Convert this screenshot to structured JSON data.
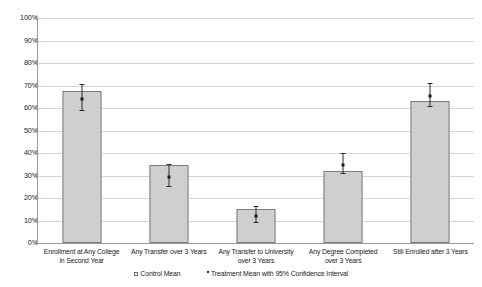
{
  "chart_data": {
    "type": "bar",
    "title": "",
    "xlabel": "",
    "ylabel": "",
    "ylim": [
      0,
      100
    ],
    "grid": true,
    "legend_position": "bottom",
    "y_tick_labels": [
      "100%",
      "90%",
      "80%",
      "70%",
      "60%",
      "50%",
      "40%",
      "30%",
      "20%",
      "10%",
      "0%"
    ],
    "y_tick_values": [
      100,
      90,
      80,
      70,
      60,
      50,
      40,
      30,
      20,
      10,
      0
    ],
    "categories": [
      "Enrollment at Any College in Second Year",
      "Any Transfer over 3 Years",
      "Any Transfer to University over 3 Years",
      "Any Degree Completed over 3 Years",
      "Still Enrolled after 3 Years"
    ],
    "category_labels": [
      [
        "Enrollment at Any College",
        "in Second Year"
      ],
      [
        "Any Transfer over 3 Years",
        ""
      ],
      [
        "Any Transfer to University",
        "over 3 Years"
      ],
      [
        "Any Degree Completed",
        "over 3 Years"
      ],
      [
        "Still Enrolled after 3 Years",
        ""
      ]
    ],
    "series": [
      {
        "name": "Control Mean",
        "type": "bar",
        "values": [
          67.5,
          34.5,
          15.0,
          32.0,
          63.0
        ]
      },
      {
        "name": "Treatment Mean with 95% Confidence Interval",
        "type": "point-with-errorbar",
        "values": [
          64.5,
          30.0,
          12.5,
          35.5,
          66.0
        ],
        "ci_lower": [
          59.0,
          25.5,
          9.5,
          31.0,
          61.0
        ],
        "ci_upper": [
          70.5,
          35.0,
          16.5,
          40.0,
          71.0
        ]
      }
    ],
    "legend": [
      {
        "label": "Control Mean",
        "marker": "open-square"
      },
      {
        "label": "Treatment Mean with 95% Confidence Interval",
        "marker": "dot"
      }
    ],
    "colors": {
      "bar_fill": "#cfcfcf",
      "bar_border": "#7d7d7d",
      "error_bar": "#2a2a2a",
      "grid": "#d4d4d4",
      "axis": "#9a9a9a",
      "text": "#1b1b1b"
    }
  }
}
